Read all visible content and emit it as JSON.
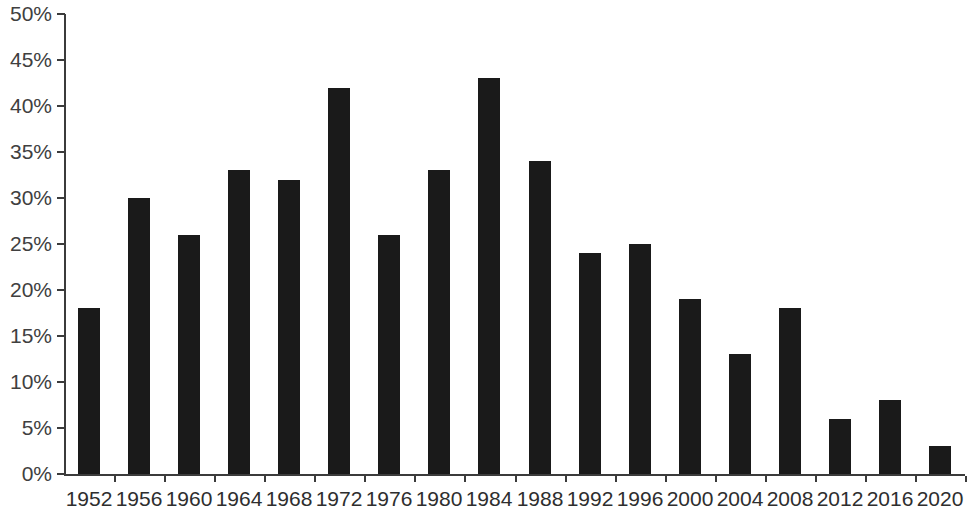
{
  "chart_data": {
    "type": "bar",
    "title": "",
    "subtitle": "",
    "xlabel": "",
    "ylabel": "",
    "grid": false,
    "legend": null,
    "bar_color": "#1a1a1a",
    "axis_color": "#3b3b3b",
    "background_color": "#ffffff",
    "ylim": [
      0,
      50
    ],
    "y_tick_step": 5,
    "y_tick_labels": [
      "50%",
      "45%",
      "40%",
      "35%",
      "30%",
      "25%",
      "20%",
      "15%",
      "10%",
      "5%",
      "0%"
    ],
    "y_tick_values": [
      50,
      45,
      40,
      35,
      30,
      25,
      20,
      15,
      10,
      5,
      0
    ],
    "value_suffix": "%",
    "categories": [
      "1952",
      "1956",
      "1960",
      "1964",
      "1968",
      "1972",
      "1976",
      "1980",
      "1984",
      "1988",
      "1992",
      "1996",
      "2000",
      "2004",
      "2008",
      "2012",
      "2016",
      "2020"
    ],
    "values": [
      18,
      30,
      26,
      33,
      32,
      42,
      26,
      33,
      43,
      34,
      24,
      25,
      19,
      13,
      18,
      6,
      8,
      3
    ]
  }
}
